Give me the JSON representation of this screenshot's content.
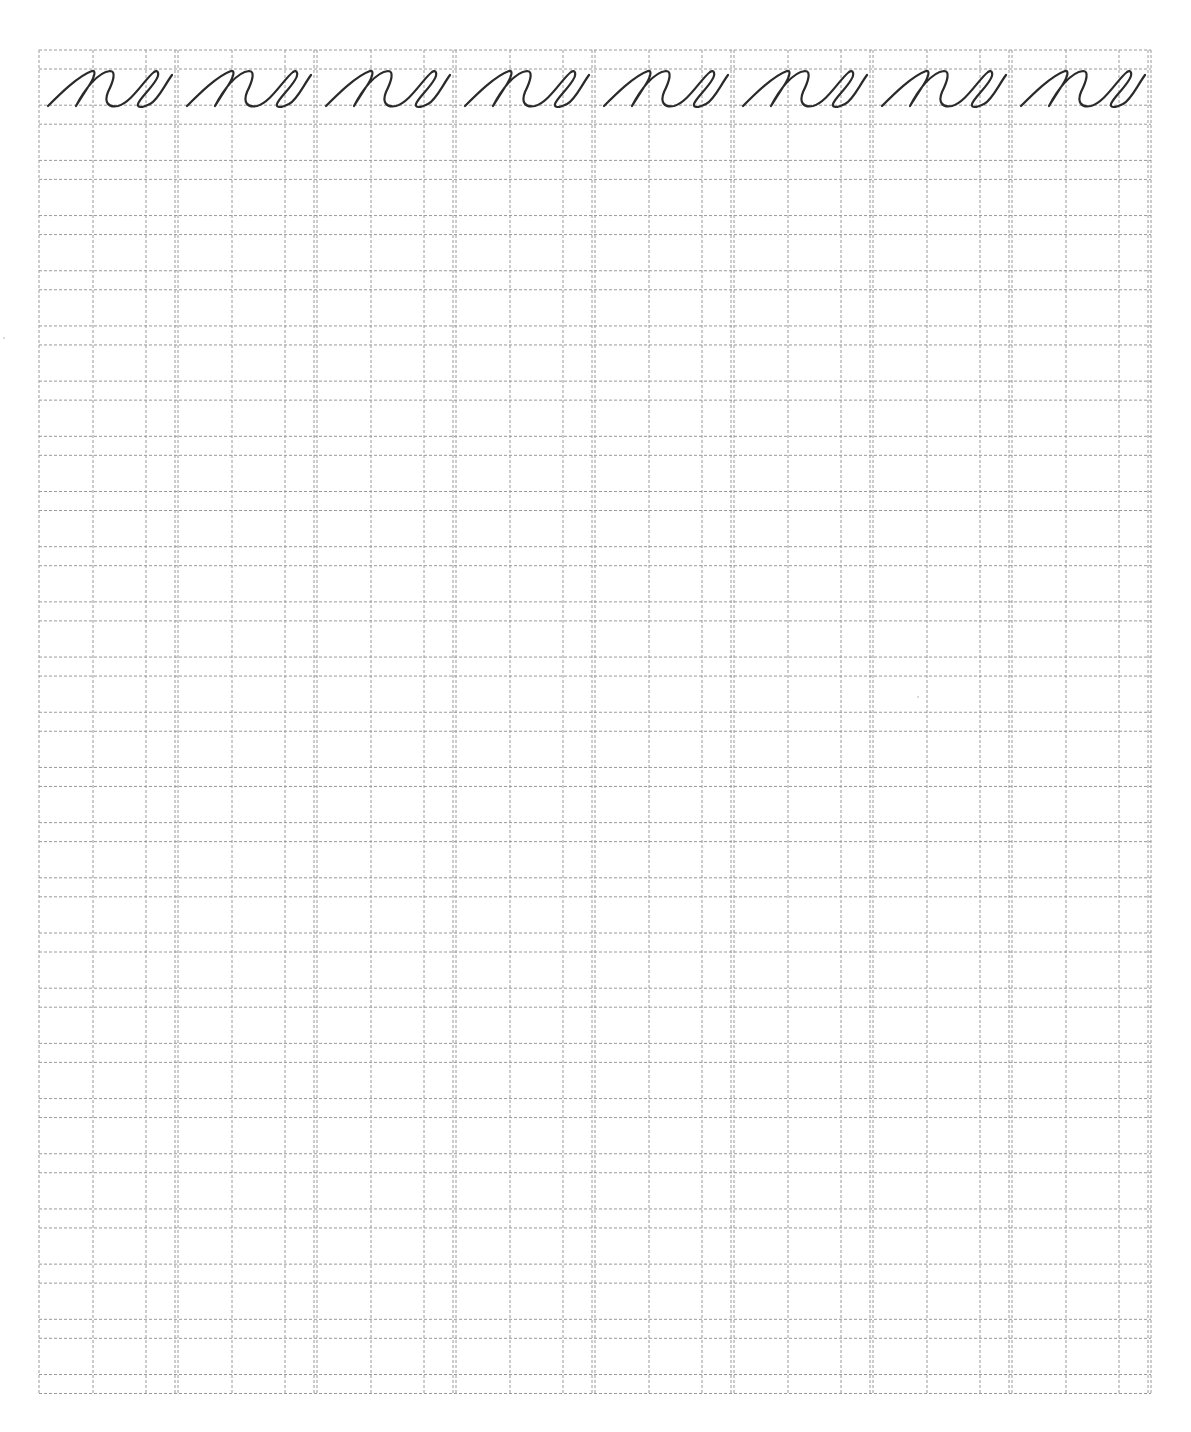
{
  "worksheet": {
    "type": "cursive handwriting practice sheet",
    "practice_text": "ne",
    "sample_row": {
      "repeat_count": 8,
      "samples": [
        "ne",
        "ne",
        "ne",
        "ne",
        "ne",
        "ne",
        "ne",
        "ne"
      ]
    },
    "grid": {
      "columns": 8,
      "line_pairs": 25,
      "line_color": "#9a9a9a",
      "ink_color": "#2a2a2a",
      "background": "#ffffff"
    }
  }
}
